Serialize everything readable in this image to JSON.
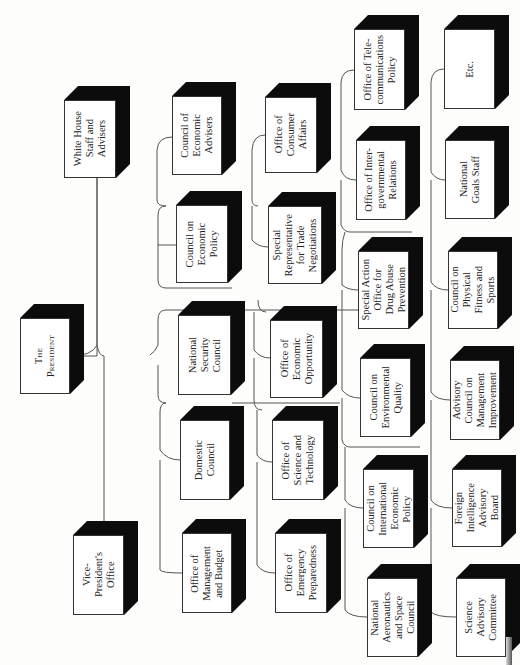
{
  "document": {
    "type": "organization-chart",
    "orientation": "rotated-90-ccw",
    "shadow_color": "#0c0c0c",
    "line_color": "#555555"
  },
  "boxes": [
    {
      "id": "white-house-staff",
      "label": "White House\nStaff and\nAdvisers",
      "x": 64,
      "y": 100,
      "w": 52,
      "h": 78
    },
    {
      "id": "president",
      "label": "The\nPresident",
      "x": 20,
      "y": 318,
      "w": 50,
      "h": 76
    },
    {
      "id": "vice-president",
      "label": "Vice-\nPresident's\nOffice",
      "x": 73,
      "y": 535,
      "w": 51,
      "h": 80
    },
    {
      "id": "council-economic-advisers",
      "label": "Council of\nEconomic\nAdvisers",
      "x": 172,
      "y": 96,
      "w": 50,
      "h": 79
    },
    {
      "id": "council-economic-policy",
      "label": "Council on\nEconomic\nPolicy",
      "x": 176,
      "y": 205,
      "w": 52,
      "h": 78
    },
    {
      "id": "national-security-council",
      "label": "National\nSecurity\nCouncil",
      "x": 178,
      "y": 315,
      "w": 53,
      "h": 80
    },
    {
      "id": "domestic-council",
      "label": "Domestic\nCouncil",
      "x": 180,
      "y": 420,
      "w": 50,
      "h": 80
    },
    {
      "id": "office-management-budget",
      "label": "Office of\nManagement\nand Budget",
      "x": 182,
      "y": 533,
      "w": 50,
      "h": 80
    },
    {
      "id": "office-consumer-affairs",
      "label": "Office of\nConsumer\nAffairs",
      "x": 265,
      "y": 97,
      "w": 52,
      "h": 76
    },
    {
      "id": "special-rep-trade",
      "label": "Special\nRepresentative\nfor Trade\nNegotiations",
      "x": 268,
      "y": 206,
      "w": 54,
      "h": 78
    },
    {
      "id": "office-economic-opportunity",
      "label": "Office of\nEconomic\nOpportunity",
      "x": 270,
      "y": 320,
      "w": 53,
      "h": 78
    },
    {
      "id": "office-science-technology",
      "label": "Office of\nScience and\nTechnology",
      "x": 272,
      "y": 420,
      "w": 52,
      "h": 80
    },
    {
      "id": "office-emergency-preparedness",
      "label": "Office of\nEmergency\nPreparedness",
      "x": 275,
      "y": 533,
      "w": 52,
      "h": 80
    },
    {
      "id": "office-telecommunications",
      "label": "Office of Tele-\ncommunications\nPolicy",
      "x": 354,
      "y": 29,
      "w": 51,
      "h": 81
    },
    {
      "id": "office-intergovernmental",
      "label": "Office of Inter-\ngovernmental\nRelations",
      "x": 356,
      "y": 140,
      "w": 50,
      "h": 80
    },
    {
      "id": "special-action-drug-abuse",
      "label": "Special Action\nOffice for\nDrug Abuse\nPrevention",
      "x": 358,
      "y": 251,
      "w": 51,
      "h": 78
    },
    {
      "id": "council-environmental-quality",
      "label": "Council on\nEnvironmental\nQuality",
      "x": 360,
      "y": 358,
      "w": 51,
      "h": 79
    },
    {
      "id": "council-international-economic",
      "label": "Council on\nInternational\nEconomic\nPolicy",
      "x": 363,
      "y": 469,
      "w": 51,
      "h": 79
    },
    {
      "id": "nasa-council",
      "label": "National\nAeronautics\nand Space\nCouncil",
      "x": 367,
      "y": 578,
      "w": 51,
      "h": 79
    },
    {
      "id": "etc",
      "label": "Etc.",
      "x": 444,
      "y": 29,
      "w": 51,
      "h": 80
    },
    {
      "id": "national-goals-staff",
      "label": "National\nGoals Staff",
      "x": 445,
      "y": 140,
      "w": 50,
      "h": 79
    },
    {
      "id": "council-physical-fitness",
      "label": "Council on\nPhysical\nFitness and\nSports",
      "x": 448,
      "y": 251,
      "w": 50,
      "h": 78
    },
    {
      "id": "advisory-council-management",
      "label": "Advisory\nCouncil on\nManagement\nImprovement",
      "x": 450,
      "y": 360,
      "w": 50,
      "h": 80
    },
    {
      "id": "foreign-intelligence-board",
      "label": "Foreign\nIntelligence\nAdvisory\nBoard",
      "x": 452,
      "y": 469,
      "w": 50,
      "h": 78
    },
    {
      "id": "science-advisory-committee",
      "label": "Science\nAdvisory\nCommittee",
      "x": 456,
      "y": 578,
      "w": 50,
      "h": 79
    }
  ]
}
